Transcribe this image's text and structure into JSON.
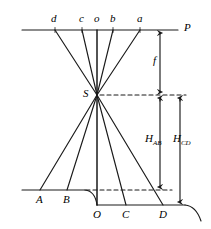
{
  "figure": {
    "stroke_color": "#1a1a1a",
    "background_color": "#ffffff",
    "labels": {
      "top_line_right": "P",
      "image_points": [
        "d",
        "c",
        "o",
        "b",
        "a"
      ],
      "perspective_center": "S",
      "focal_length": "f",
      "ground_upper": [
        "A",
        "B"
      ],
      "ground_lower": [
        "O",
        "C",
        "D"
      ],
      "height_ab_main": "H",
      "height_ab_sub": "AB",
      "height_cd_main": "H",
      "height_cd_sub": "CD"
    },
    "geometry": {
      "top_line_y": 30,
      "top_line_x1": 22,
      "top_line_x2": 178,
      "station_point": {
        "x": 97,
        "y": 95
      },
      "image_point_x": {
        "d": 55,
        "c": 82,
        "o": 97,
        "b": 113,
        "a": 140
      },
      "upper_ground_y": 190,
      "lower_ground_y": 205,
      "ground_point_x": {
        "A": 40,
        "B": 67,
        "O": 97,
        "C": 126,
        "D": 163
      },
      "dim_f_x": 160,
      "dim_hab_x": 160,
      "dim_hcd_x": 180
    }
  }
}
